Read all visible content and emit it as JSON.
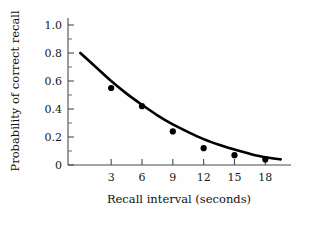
{
  "chart_data": {
    "type": "scatter",
    "title": "",
    "xlabel": "Recall interval (seconds)",
    "ylabel": "Probability of correct recall",
    "x": [
      3,
      6,
      9,
      12,
      15,
      18
    ],
    "values": [
      0.55,
      0.42,
      0.24,
      0.12,
      0.07,
      0.04
    ],
    "series": [
      {
        "name": "Observed recall probability",
        "x": [
          3,
          6,
          9,
          12,
          15,
          18
        ],
        "values": [
          0.55,
          0.42,
          0.24,
          0.12,
          0.07,
          0.04
        ]
      },
      {
        "name": "Fitted decay curve",
        "type": "line",
        "x": [
          0,
          1.5,
          3,
          4.5,
          6,
          7.5,
          9,
          10.5,
          12,
          13.5,
          15,
          16.5,
          18,
          19.5
        ],
        "values": [
          0.8,
          0.7,
          0.6,
          0.51,
          0.43,
          0.355,
          0.29,
          0.235,
          0.185,
          0.145,
          0.11,
          0.08,
          0.055,
          0.04
        ]
      }
    ],
    "xlim": [
      -1.2,
      20.5
    ],
    "ylim": [
      0,
      1.05
    ],
    "xticks": [
      3,
      6,
      9,
      12,
      15,
      18
    ],
    "xtick_labels": [
      "3",
      "6",
      "9",
      "12",
      "15",
      "18"
    ],
    "yticks": [
      0,
      0.2,
      0.4,
      0.6,
      0.8,
      1.0
    ],
    "ytick_labels": [
      "0",
      "0.2",
      "0.4",
      "0.6",
      "0.8",
      "1.0"
    ],
    "yticks_minor": [
      0.1,
      0.3,
      0.5,
      0.7,
      0.9
    ],
    "grid": false,
    "legend": "none",
    "curve_intercept": 0.8,
    "colors": {
      "curve": "#000000",
      "points": "#000000",
      "axis": "#4a4a4a",
      "background": "#fefefe"
    }
  }
}
